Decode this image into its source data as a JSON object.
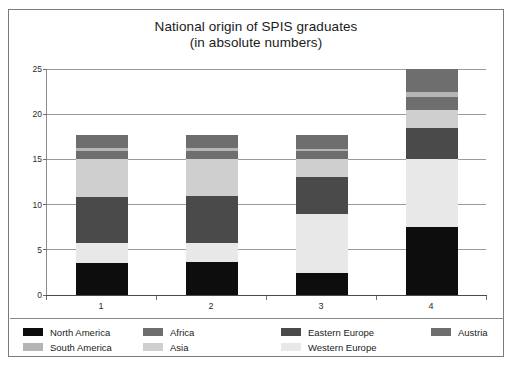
{
  "chart_data": {
    "type": "bar",
    "subtype": "stacked-bar",
    "title": "National origin of SPIS graduates",
    "subtitle": "(in absolute numbers)",
    "xlabel": "",
    "ylabel": "",
    "categories": [
      "1",
      "2",
      "3",
      "4"
    ],
    "ylim": [
      0,
      25
    ],
    "yticks": [
      0,
      5,
      10,
      15,
      20,
      25
    ],
    "grid": true,
    "legend_position": "bottom",
    "series": [
      {
        "name": "North America",
        "color": "#0d0d0d",
        "values": [
          3.5,
          3.6,
          2.4,
          7.5
        ]
      },
      {
        "name": "Western Europe",
        "color": "#e8e8e8",
        "values": [
          2.3,
          2.2,
          6.6,
          7.5
        ]
      },
      {
        "name": "Eastern Europe",
        "color": "#4a4a4a",
        "values": [
          5.0,
          5.1,
          4.0,
          3.5
        ]
      },
      {
        "name": "Asia",
        "color": "#cfcfcf",
        "values": [
          4.2,
          4.1,
          2.1,
          2.0
        ]
      },
      {
        "name": "Africa",
        "color": "#6e6e6e",
        "values": [
          0.9,
          0.9,
          0.8,
          1.4
        ]
      },
      {
        "name": "South America",
        "color": "#b5b5b5",
        "values": [
          0.4,
          0.4,
          0.3,
          0.6
        ]
      },
      {
        "name": "Austria",
        "color": "#6e6e6e",
        "values": [
          1.4,
          1.4,
          1.5,
          2.5
        ]
      }
    ],
    "bar_totals": [
      17.7,
      17.7,
      17.7,
      25.0
    ],
    "stack_order_bottom_to_top": [
      "North America",
      "Western Europe",
      "Eastern Europe",
      "Asia",
      "Africa",
      "South America",
      "Austria"
    ]
  },
  "legend": {
    "items": [
      {
        "label": "North America",
        "color": "#0d0d0d",
        "col": 0,
        "row": 0
      },
      {
        "label": "South America",
        "color": "#b5b5b5",
        "col": 0,
        "row": 1
      },
      {
        "label": "Africa",
        "color": "#6e6e6e",
        "col": 1,
        "row": 0
      },
      {
        "label": "Asia",
        "color": "#cfcfcf",
        "col": 1,
        "row": 1
      },
      {
        "label": "Eastern Europe",
        "color": "#4a4a4a",
        "col": 2,
        "row": 0
      },
      {
        "label": "Western Europe",
        "color": "#e8e8e8",
        "col": 2,
        "row": 1
      },
      {
        "label": "Austria",
        "color": "#6e6e6e",
        "col": 3,
        "row": 0
      }
    ]
  },
  "colors": {
    "frame_border": "#7a7a7a",
    "gridline": "#9a9a9a",
    "axis": "#6d6d6d",
    "background": "#ffffff",
    "text": "#1a1a1a"
  }
}
